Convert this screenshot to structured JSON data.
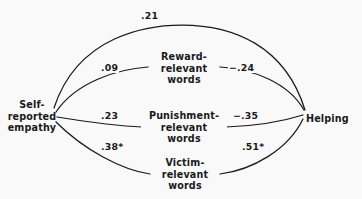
{
  "diagram": {
    "type": "path-diagram",
    "background_color": "#faf9fa",
    "line_color": "#1a1a1a",
    "nodes": {
      "predictor": {
        "id": "self-reported-empathy",
        "lines": [
          "Self-",
          "reported",
          "empathy"
        ]
      },
      "outcome": {
        "id": "helping",
        "lines": [
          "Helping"
        ]
      },
      "mediators": [
        {
          "id": "reward-relevant-words",
          "lines": [
            "Reward-",
            "relevant",
            "words"
          ]
        },
        {
          "id": "punishment-relevant-words",
          "lines": [
            "Punishment-",
            "relevant",
            "words"
          ]
        },
        {
          "id": "victim-relevant-words",
          "lines": [
            "Victim-",
            "relevant",
            "words"
          ]
        }
      ]
    },
    "paths": [
      {
        "id": "direct",
        "from": "self-reported-empathy",
        "to": "helping",
        "coefficient": ".21",
        "significant": false
      },
      {
        "id": "empathy-to-reward",
        "from": "self-reported-empathy",
        "to": "reward-relevant-words",
        "coefficient": ".09",
        "significant": false
      },
      {
        "id": "reward-to-helping",
        "from": "reward-relevant-words",
        "to": "helping",
        "coefficient": "−.24",
        "significant": false
      },
      {
        "id": "empathy-to-punishment",
        "from": "self-reported-empathy",
        "to": "punishment-relevant-words",
        "coefficient": ".23",
        "significant": false
      },
      {
        "id": "punishment-to-helping",
        "from": "punishment-relevant-words",
        "to": "helping",
        "coefficient": "−.35",
        "significant": false
      },
      {
        "id": "empathy-to-victim",
        "from": "self-reported-empathy",
        "to": "victim-relevant-words",
        "coefficient": ".38*",
        "significant": true
      },
      {
        "id": "victim-to-helping",
        "from": "victim-relevant-words",
        "to": "helping",
        "coefficient": ".51*",
        "significant": true
      }
    ]
  }
}
